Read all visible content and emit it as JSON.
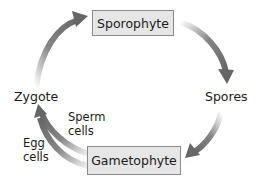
{
  "diagram": {
    "nodes": {
      "sporophyte": "Sporophyte",
      "spores": "Spores",
      "gametophyte": "Gametophyte",
      "zygote": "Zygote"
    },
    "edge_labels": {
      "sperm_line1": "Sperm",
      "sperm_line2": "cells",
      "egg_line1": "Egg",
      "egg_line2": "cells"
    },
    "edges": [
      {
        "from": "Zygote",
        "to": "Sporophyte"
      },
      {
        "from": "Sporophyte",
        "to": "Spores"
      },
      {
        "from": "Spores",
        "to": "Gametophyte"
      },
      {
        "from": "Gametophyte",
        "to": "Zygote",
        "label": "Sperm cells"
      },
      {
        "from": "Gametophyte",
        "to": "Zygote",
        "label": "Egg cells"
      }
    ],
    "colors": {
      "box_fill": "#e6e6e6",
      "box_border": "#8a8a8a",
      "arrow": "#6e6e6e"
    }
  }
}
